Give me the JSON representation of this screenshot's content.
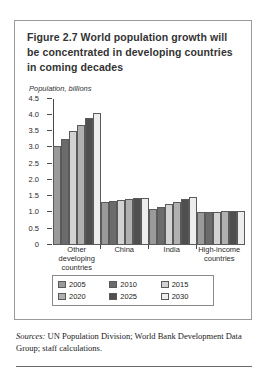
{
  "figure": {
    "title_line1": "Figure 2.7  World population growth will",
    "title_line2": "be concentrated in developing countries",
    "title_line3": "in coming decades",
    "axis_label": "Population, billions"
  },
  "sources": {
    "prefix": "Sources:",
    "text": " UN Population Division; World Bank Development Data Group; staff calculations."
  },
  "chart_data": {
    "type": "bar",
    "title": "Figure 2.7  World population growth will be concentrated in developing countries in coming decades",
    "xlabel": "",
    "ylabel": "Population, billions",
    "ylim": [
      0,
      4.5
    ],
    "yticks": [
      "0",
      "0.5",
      "1.0",
      "1.5",
      "2.0",
      "2.5",
      "3.0",
      "3.5",
      "4.0",
      "4.5"
    ],
    "ytick_values": [
      0,
      0.5,
      1.0,
      1.5,
      2.0,
      2.5,
      3.0,
      3.5,
      4.0,
      4.5
    ],
    "grid": false,
    "legend_position": "bottom",
    "categories": [
      "Other developing countries",
      "China",
      "India",
      "High-income countries"
    ],
    "category_lines": [
      [
        "Other",
        "developing",
        "countries"
      ],
      [
        "China"
      ],
      [
        "India"
      ],
      [
        "High-income",
        "countries"
      ]
    ],
    "series": [
      {
        "name": "2005",
        "color": "#9a9a9a",
        "values": [
          3.05,
          1.31,
          1.1,
          1.0
        ]
      },
      {
        "name": "2010",
        "color": "#6b6b6b",
        "values": [
          3.25,
          1.35,
          1.17,
          1.01
        ]
      },
      {
        "name": "2015",
        "color": "#d2d2d2",
        "values": [
          3.5,
          1.39,
          1.25,
          1.02
        ]
      },
      {
        "name": "2020",
        "color": "#b0b0b0",
        "values": [
          3.7,
          1.42,
          1.33,
          1.03
        ]
      },
      {
        "name": "2025",
        "color": "#4f4f4f",
        "values": [
          3.9,
          1.44,
          1.4,
          1.03
        ]
      },
      {
        "name": "2030",
        "color": "#ededed",
        "values": [
          4.05,
          1.44,
          1.46,
          1.03
        ]
      }
    ]
  }
}
